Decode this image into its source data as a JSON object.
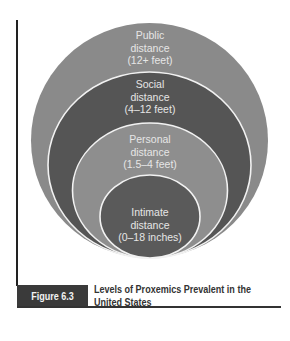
{
  "figure": {
    "number": "Figure 6.3",
    "caption_line1": "Levels of Proxemics Prevalent in the",
    "caption_line2": "United States"
  },
  "levels": [
    {
      "name": "Public",
      "line1": "Public",
      "line2": "distance",
      "line3": "(12+ feet)",
      "color": "#8a8a8a"
    },
    {
      "name": "Social",
      "line1": "Social",
      "line2": "distance",
      "line3": "(4–12 feet)",
      "color": "#555555"
    },
    {
      "name": "Personal",
      "line1": "Personal",
      "line2": "distance",
      "line3": "(1.5–4 feet)",
      "color": "#8e8e8e"
    },
    {
      "name": "Intimate",
      "line1": "Intimate",
      "line2": "distance",
      "line3": "(0–18 inches)",
      "color": "#5a5a5a"
    }
  ],
  "colors": {
    "ring_border": "#f2f2f2",
    "caption_box": "#3a3a3a",
    "frame_line": "#222222"
  }
}
